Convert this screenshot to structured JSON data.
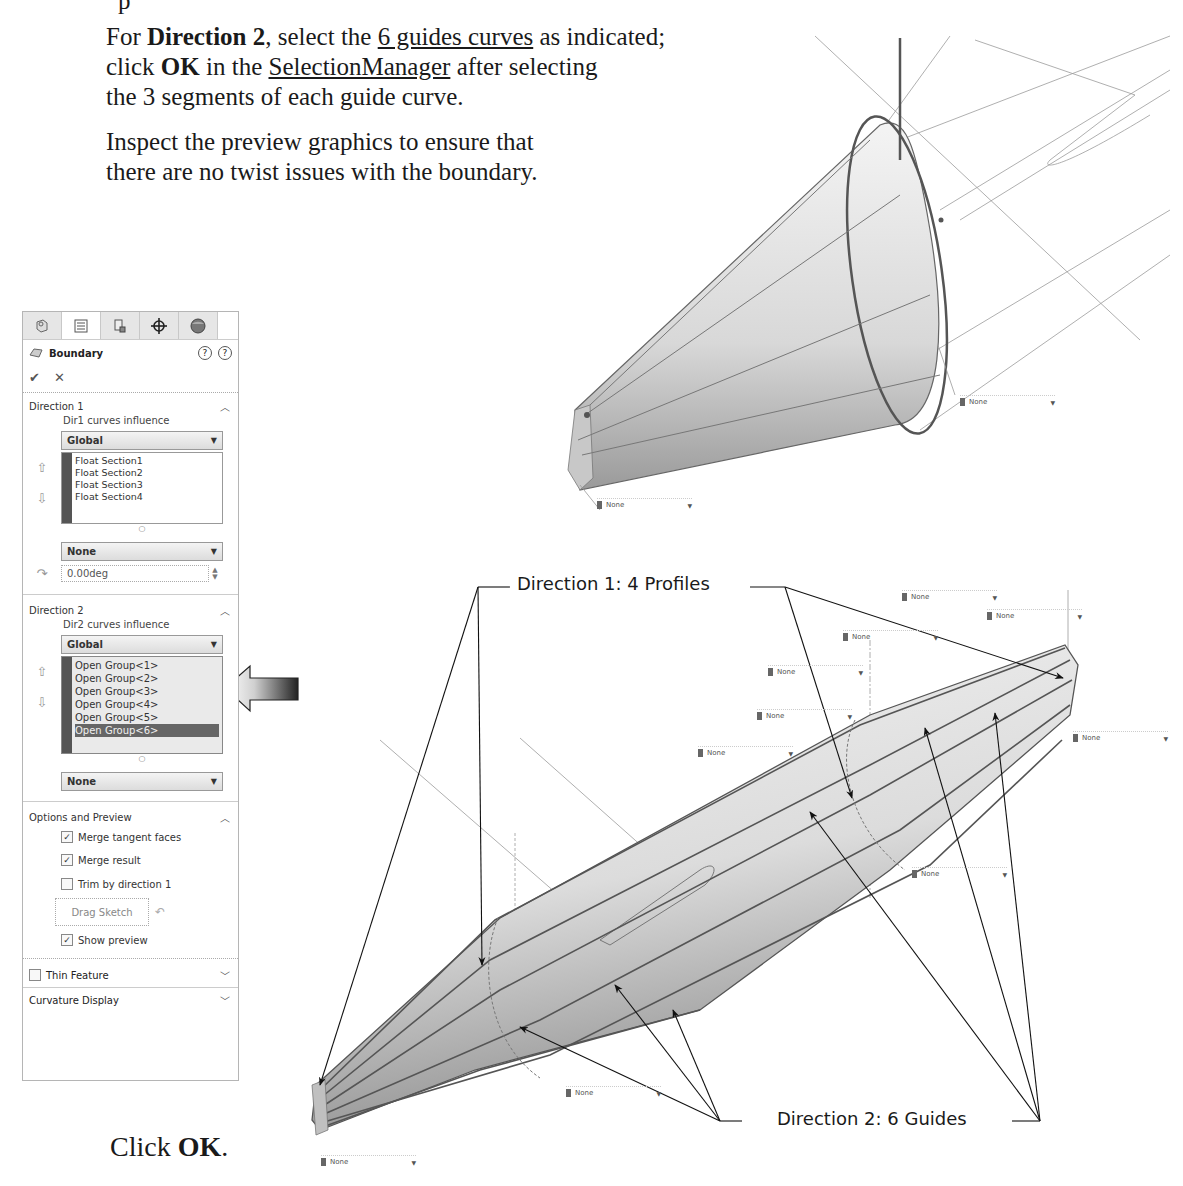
{
  "instructions": {
    "top_remnant": "p",
    "p1": {
      "part1": "For ",
      "bold1": "Direction 2",
      "part2": ", select the ",
      "underline1": "6 guides curves",
      "part3": " as indicated;",
      "line2_part1": "click ",
      "bold2": "OK",
      "line2_part2": " in the ",
      "underline2": "SelectionManager",
      "line2_part3": " after selecting",
      "line3": "the 3 segments of each guide curve."
    },
    "p2": {
      "line1": "Inspect the preview graphics to ensure that",
      "line2": "there are no twist issues with the boundary."
    },
    "click_ok": {
      "prefix": "Click ",
      "bold": "OK",
      "suffix": "."
    }
  },
  "panel": {
    "tabs": [
      {
        "name": "feature-manager-tab",
        "icon": "feature-tree-icon"
      },
      {
        "name": "property-manager-tab",
        "icon": "property-list-icon",
        "active": true
      },
      {
        "name": "configuration-manager-tab",
        "icon": "configuration-icon"
      },
      {
        "name": "dimxpert-tab",
        "icon": "crosshair-icon"
      },
      {
        "name": "display-manager-tab",
        "icon": "appearance-sphere-icon"
      }
    ],
    "title": "Boundary",
    "ok_symbol": "✔",
    "cancel_symbol": "✕",
    "direction1": {
      "header": "Direction 1",
      "influence_label": "Dir1 curves influence",
      "influence_value": "Global",
      "items": [
        "Float Section1",
        "Float Section2",
        "Float Section3",
        "Float Section4"
      ],
      "tangency_value": "None",
      "angle_value": "0.00deg"
    },
    "direction2": {
      "header": "Direction 2",
      "influence_label": "Dir2 curves influence",
      "influence_value": "Global",
      "items": [
        "Open Group<1>",
        "Open Group<2>",
        "Open Group<3>",
        "Open Group<4>",
        "Open Group<5>",
        "Open Group<6>"
      ],
      "selected_index": 5,
      "tangency_value": "None"
    },
    "options": {
      "header": "Options and Preview",
      "merge_tangent_faces": {
        "label": "Merge tangent faces",
        "checked": true
      },
      "merge_result": {
        "label": "Merge result",
        "checked": true
      },
      "trim_by_direction1": {
        "label": "Trim by direction 1",
        "checked": false
      },
      "drag_sketch": "Drag Sketch",
      "show_preview": {
        "label": "Show preview",
        "checked": true
      }
    },
    "thin_feature": {
      "label": "Thin Feature",
      "checked": false
    },
    "curvature_display": "Curvature Display"
  },
  "graphics": {
    "callout_dir1": "Direction 1: 4 Profiles",
    "callout_dir2": "Direction 2: 6 Guides",
    "none_tag": "None",
    "arrow_pointer_colors": [
      "#ffffff",
      "#222222"
    ]
  }
}
